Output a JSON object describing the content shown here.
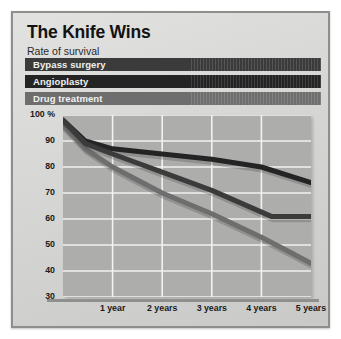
{
  "header": {
    "title": "The Knife Wins",
    "subtitle": "Rate of survival"
  },
  "legend": {
    "items": [
      {
        "label": "Bypass surgery",
        "color": "#3b3b3b"
      },
      {
        "label": "Angioplasty",
        "color": "#242424"
      },
      {
        "label": "Drug treatment",
        "color": "#6e6e6e"
      }
    ]
  },
  "chart_data": {
    "type": "line",
    "title": "The Knife Wins",
    "subtitle": "Rate of survival",
    "xlabel": "",
    "ylabel": "",
    "categories": [
      "1 year",
      "2 years",
      "3 years",
      "4 years",
      "5 years"
    ],
    "x": [
      0,
      1,
      2,
      3,
      4,
      5
    ],
    "xlim": [
      0,
      5
    ],
    "ylim": [
      30,
      100
    ],
    "yticks": [
      100,
      90,
      80,
      70,
      60,
      50,
      40,
      30
    ],
    "ytick_labels": [
      "100 %",
      "90",
      "80",
      "70",
      "60",
      "50",
      "40",
      "30"
    ],
    "grid": true,
    "legend_position": "top",
    "series": [
      {
        "name": "Angioplasty",
        "color": "#242424",
        "values": [
          98,
          90,
          87,
          85,
          83,
          80,
          74
        ],
        "x": [
          0,
          0.45,
          1,
          2,
          3,
          4,
          5
        ]
      },
      {
        "name": "Bypass surgery",
        "color": "#3b3b3b",
        "values": [
          98,
          89,
          85,
          78,
          71,
          66,
          61,
          61
        ],
        "x": [
          0,
          0.45,
          1,
          2,
          3,
          3.6,
          4.2,
          5
        ]
      },
      {
        "name": "Drug treatment",
        "color": "#6e6e6e",
        "values": [
          96,
          87,
          80,
          70,
          62,
          53,
          47,
          43
        ],
        "x": [
          0,
          0.45,
          1,
          2,
          3,
          4,
          4.6,
          5
        ]
      }
    ]
  }
}
